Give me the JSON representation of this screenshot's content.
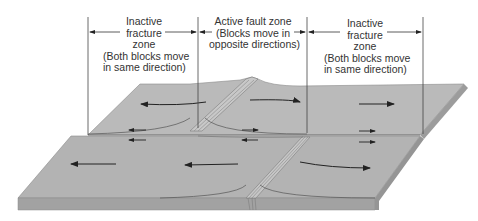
{
  "figure": {
    "type": "transform fault block diagram",
    "colors": {
      "surface": "#b9b9b9",
      "surface_dark": "#a5a5a5",
      "side": "#9a9a9a",
      "ridge": "#8c8c8c",
      "lines": "#333333",
      "background": "#ffffff"
    }
  },
  "zones": [
    {
      "name": "left-inactive-zone",
      "lines": [
        "Inactive",
        "fracture",
        "zone",
        "(Both blocks move",
        "in same direction)"
      ]
    },
    {
      "name": "active-fault-zone",
      "lines": [
        "Active fault zone",
        "(Blocks move in",
        "opposite directions)"
      ]
    },
    {
      "name": "right-inactive-zone",
      "lines": [
        "Inactive",
        "fracture",
        "zone",
        "(Both blocks move",
        "in same direction)"
      ]
    }
  ],
  "arrows": {
    "upper_block": [
      "left",
      "left",
      "right",
      "right"
    ],
    "lower_block": [
      "left",
      "left",
      "right"
    ],
    "fracture_pairs": [
      "left-inactive",
      "active",
      "right-inactive"
    ]
  }
}
